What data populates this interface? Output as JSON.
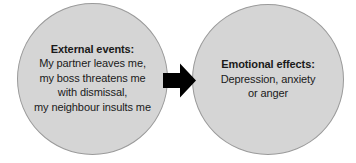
{
  "diagram": {
    "background_color": "#ffffff",
    "nodes": [
      {
        "id": "external-events",
        "shape": "circle",
        "fill_color": "#d5d5d5",
        "border_color": "#9a9a9a",
        "heading": "External events:",
        "lines": [
          "My partner leaves me,",
          "my boss threatens me",
          "with dismissal,",
          "my neighbour insults me"
        ]
      },
      {
        "id": "emotional-effects",
        "shape": "circle",
        "fill_color": "#d5d5d5",
        "border_color": "#9a9a9a",
        "heading": "Emotional effects:",
        "lines": [
          "Depression, anxiety",
          "or anger"
        ]
      }
    ],
    "connector": {
      "id": "arrow",
      "icon": "arrow-right-icon",
      "direction": "right",
      "from": "external-events",
      "to": "emotional-effects",
      "color": "#000000"
    }
  }
}
